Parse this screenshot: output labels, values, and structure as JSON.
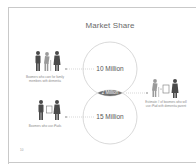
{
  "slide": {
    "title": "Market Share",
    "page_number": "10"
  },
  "venn": {
    "top_circle": {
      "label": "10 Million",
      "value_millions": 10
    },
    "bottom_circle": {
      "label": "15 Million",
      "value_millions": 15
    },
    "intersection": {
      "label": "2 Million",
      "value_millions": 2
    }
  },
  "groups": {
    "caregivers": {
      "caption": "Boomers who care for family members with dementia",
      "icon": "people-group-with-elderly-icon"
    },
    "ipad_users": {
      "caption": "Boomers who use iPads",
      "icon": "people-with-tablet-icon"
    },
    "overlap": {
      "caption": "Estimate # of boomers who will use iPad with dementia parent",
      "icon": "elderly-tablet-person-icon"
    }
  },
  "colors": {
    "figure_dark": "#4a4a4a",
    "figure_light": "#9a9a9a",
    "circle_stroke": "#cfcfcf",
    "lens_fill": "#6e6e6e",
    "connector": "#bdbdbd"
  }
}
